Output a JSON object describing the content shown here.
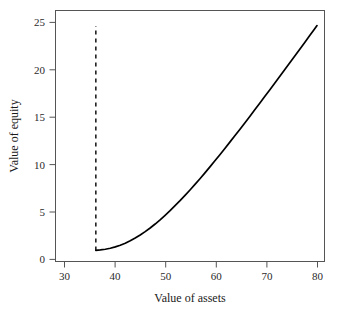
{
  "chart_data": {
    "type": "line",
    "title": "",
    "xlabel": "Value of assets",
    "ylabel": "Value of equity",
    "xlim": [
      27.5,
      81.5
    ],
    "ylim": [
      -1.2,
      26.2
    ],
    "xticks": [
      30,
      40,
      50,
      60,
      70,
      80
    ],
    "xtick_labels": [
      "30",
      "40",
      "50",
      "60",
      "70",
      "80"
    ],
    "yticks": [
      0,
      5,
      10,
      15,
      20,
      25
    ],
    "ytick_labels": [
      "0",
      "5",
      "10",
      "15",
      "20",
      "25"
    ],
    "grid": false,
    "legend": null,
    "series": [
      {
        "name": "Value of equity",
        "style": "solid",
        "color": "#000000",
        "x": [
          35.6,
          36.5,
          37.5,
          38.5,
          39.5,
          40.5,
          41.5,
          42.5,
          43.5,
          44.5,
          45.5,
          46.5,
          47.5,
          48.5,
          49.5,
          50.5,
          51.5,
          52.5,
          53.5,
          54.5,
          55.5,
          56.5,
          57.5,
          58.5,
          59.5,
          60.5,
          61.5,
          62.5,
          63.5,
          64.5,
          65.5,
          66.5,
          67.5,
          68.5,
          69.5,
          70.5,
          71.5,
          72.5,
          73.5,
          74.5,
          75.5,
          76.5,
          77.5,
          78.5,
          79.5,
          80.0
        ],
        "y": [
          0.02,
          0.06,
          0.14,
          0.25,
          0.4,
          0.58,
          0.8,
          1.06,
          1.36,
          1.69,
          2.06,
          2.46,
          2.89,
          3.35,
          3.84,
          4.35,
          4.89,
          5.44,
          6.02,
          6.61,
          7.22,
          7.84,
          8.48,
          9.13,
          9.79,
          10.46,
          11.14,
          11.83,
          12.52,
          13.22,
          13.93,
          14.64,
          15.36,
          16.08,
          16.8,
          17.53,
          18.26,
          18.99,
          19.73,
          20.47,
          21.21,
          21.95,
          22.69,
          23.43,
          24.18,
          24.55
        ]
      },
      {
        "name": "default-boundary",
        "style": "dashed",
        "color": "#000000",
        "x": [
          35.6,
          35.6
        ],
        "y": [
          0.0,
          24.5
        ]
      }
    ],
    "annotations": []
  },
  "axis": {
    "x_title": "Value of assets",
    "y_title": "Value of equity"
  }
}
